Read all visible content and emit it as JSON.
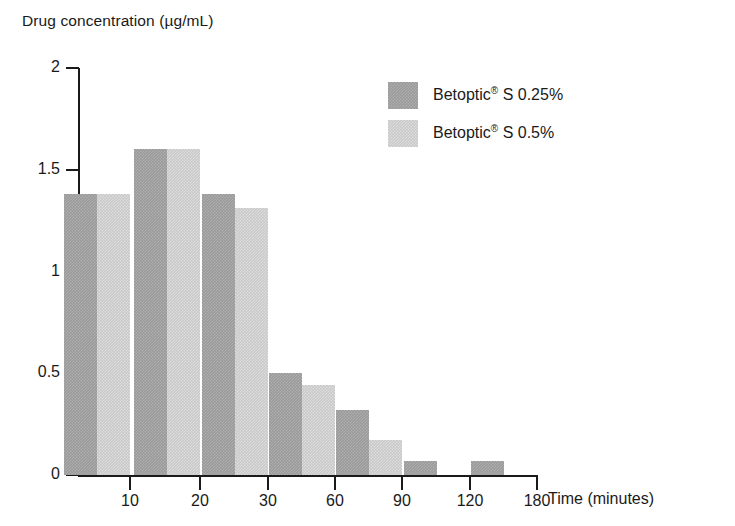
{
  "chart_data": {
    "type": "bar",
    "title": "",
    "ylabel": "Drug concentration (µg/mL)",
    "xlabel": "Time (minutes)",
    "categories": [
      "10",
      "20",
      "30",
      "60",
      "90",
      "120",
      "180"
    ],
    "series": [
      {
        "name": "Betoptic® S 0.25%",
        "name_base": "Betoptic",
        "name_sup": "®",
        "name_tail": " S 0.25%",
        "color": "#9a9a9a",
        "values": [
          1.38,
          1.6,
          1.38,
          0.5,
          0.32,
          0.07,
          0.07
        ]
      },
      {
        "name": "Betoptic® S 0.5%",
        "name_base": "Betoptic",
        "name_sup": "®",
        "name_tail": " S 0.5%",
        "color": "#c9c9c9",
        "values": [
          1.38,
          1.6,
          1.31,
          0.44,
          0.17,
          0.0,
          0.0
        ]
      }
    ],
    "yticks": [
      "0",
      "0.5",
      "1",
      "1.5",
      "2"
    ],
    "ytick_values": [
      0,
      0.5,
      1,
      1.5,
      2
    ],
    "ylim": [
      0,
      2
    ],
    "grid": false,
    "legend_position": "upper right",
    "axis_color": "#1a1a1a",
    "background": "#ffffff"
  },
  "geometry": {
    "plot_left": 78,
    "plot_baseline_y": 475,
    "plot_top_y": 68,
    "x_axis_right": 538,
    "group_tick_x": [
      130,
      200,
      268,
      335,
      402,
      470,
      537
    ],
    "bar_width": 33,
    "pair_gap": 0
  }
}
